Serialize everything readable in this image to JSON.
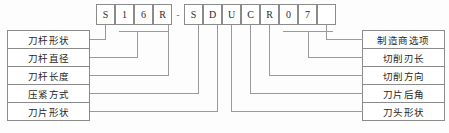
{
  "diagram": {
    "code_separator": "-",
    "code_cells": [
      {
        "pos": 1,
        "value": "S"
      },
      {
        "pos": 2,
        "value": "1"
      },
      {
        "pos": 3,
        "value": "6"
      },
      {
        "pos": 4,
        "value": "R"
      },
      {
        "pos": 5,
        "value": "S"
      },
      {
        "pos": 6,
        "value": "D"
      },
      {
        "pos": 7,
        "value": "U"
      },
      {
        "pos": 8,
        "value": "C"
      },
      {
        "pos": 9,
        "value": "R"
      },
      {
        "pos": 10,
        "value": "0"
      },
      {
        "pos": 11,
        "value": "7"
      },
      {
        "pos": 12,
        "value": ""
      }
    ],
    "left_labels": [
      {
        "label": "刀杆形状"
      },
      {
        "label": "刀杆直径"
      },
      {
        "label": "刀杆长度"
      },
      {
        "label": "压紧方式"
      },
      {
        "label": "刀片形状"
      }
    ],
    "right_labels": [
      {
        "label": "制造商选项"
      },
      {
        "label": "切削刃长"
      },
      {
        "label": "切削方向"
      },
      {
        "label": "刀片后角"
      },
      {
        "label": "刀头形状"
      }
    ],
    "caption_partial": "",
    "colors": {
      "line": "#9a9a9a",
      "border": "#8b8b8b",
      "text": "#1f1f1f",
      "background": "#fdfdfd"
    }
  }
}
